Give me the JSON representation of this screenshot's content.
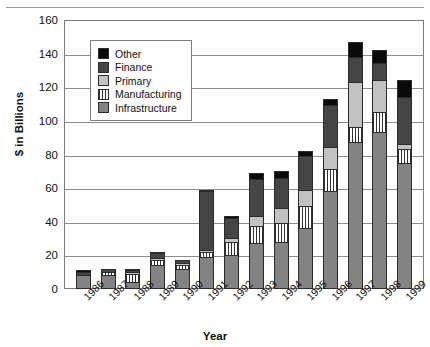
{
  "chart_data": {
    "type": "bar",
    "stacked": true,
    "title": "",
    "xlabel": "Year",
    "ylabel": "$ in Billions",
    "ylim": [
      0,
      160
    ],
    "ytick_step": 20,
    "yticks": [
      0,
      20,
      40,
      60,
      80,
      100,
      120,
      140,
      160
    ],
    "grid": true,
    "legend_position": "top-left-inside",
    "categories": [
      "1986",
      "1987",
      "1988",
      "1989",
      "1990",
      "1991",
      "1992",
      "1993",
      "1994",
      "1995",
      "1996",
      "1997",
      "1998",
      "1999"
    ],
    "series": [
      {
        "name": "Infrastructure",
        "color": "#838383",
        "values": [
          7,
          7,
          3,
          13,
          11,
          18,
          19,
          26,
          27,
          35,
          57,
          86,
          92,
          74
        ]
      },
      {
        "name": "Manufacturing",
        "color": "#ffffff",
        "pattern": "vertical-stripes",
        "values": [
          0,
          2,
          5,
          3,
          2,
          3,
          8,
          10,
          11,
          13,
          13,
          9,
          12,
          8
        ]
      },
      {
        "name": "Primary",
        "color": "#c2c2c2",
        "values": [
          0,
          0,
          1,
          1,
          1,
          1,
          2,
          6,
          9,
          10,
          13,
          27,
          19,
          3
        ]
      },
      {
        "name": "Finance",
        "color": "#454545",
        "values": [
          2,
          2,
          1,
          3,
          2,
          35,
          12,
          22,
          18,
          20,
          25,
          15,
          10,
          28
        ]
      },
      {
        "name": "Other",
        "color": "#0a0a0a",
        "values": [
          1,
          0,
          1,
          1,
          0,
          1,
          1,
          4,
          4,
          3,
          4,
          9,
          8,
          10
        ]
      }
    ],
    "totals": [
      10,
      11,
      11,
      21,
      16,
      58,
      42,
      68,
      69,
      81,
      112,
      146,
      141,
      123
    ]
  },
  "legend": {
    "items": [
      {
        "label": "Other",
        "swatch": "swatch-other"
      },
      {
        "label": "Finance",
        "swatch": "swatch-finance"
      },
      {
        "label": "Primary",
        "swatch": "swatch-primary"
      },
      {
        "label": "Manufacturing",
        "swatch": "swatch-manufacturing"
      },
      {
        "label": "Infrastructure",
        "swatch": "swatch-infrastructure"
      }
    ]
  }
}
